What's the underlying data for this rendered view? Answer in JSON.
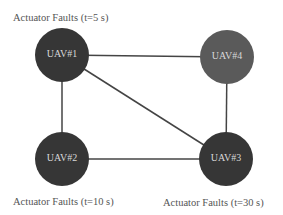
{
  "nodes": [
    {
      "id": "UAV#1",
      "label": "UAV#1",
      "color": "#363636"
    },
    {
      "id": "UAV#2",
      "label": "UAV#2",
      "color": "#363636"
    },
    {
      "id": "UAV#3",
      "label": "UAV#3",
      "color": "#363636"
    },
    {
      "id": "UAV#4",
      "label": "UAV#4",
      "color": "#5a5a5a"
    }
  ],
  "edges": [
    [
      "UAV#1",
      "UAV#4"
    ],
    [
      "UAV#1",
      "UAV#2"
    ],
    [
      "UAV#1",
      "UAV#3"
    ],
    [
      "UAV#2",
      "UAV#3"
    ],
    [
      "UAV#4",
      "UAV#3"
    ]
  ],
  "annotations": {
    "uav1": "Actuator Faults (t=5 s)",
    "uav2": "Actuator Faults (t=10 s)",
    "uav3": "Actuator Faults (t=30 s)"
  }
}
